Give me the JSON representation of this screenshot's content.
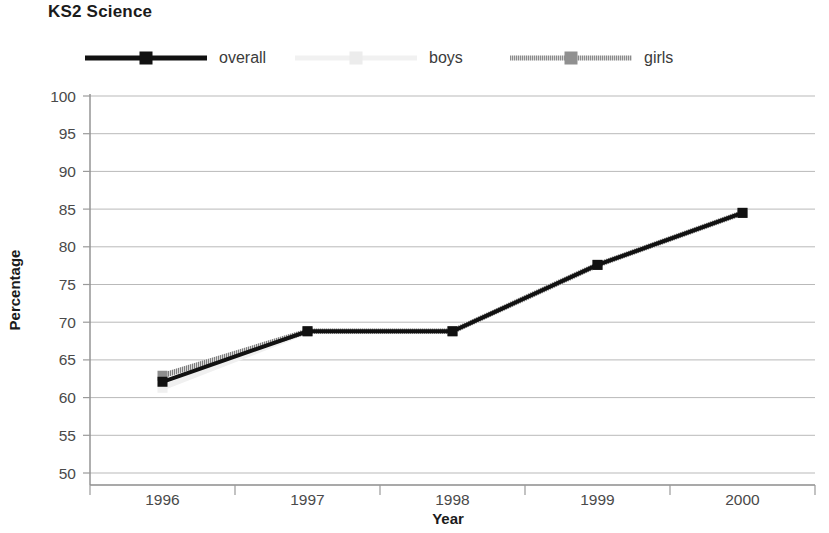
{
  "chart_data": {
    "type": "line",
    "title": "KS2 Science",
    "xlabel": "Year",
    "ylabel": "Percentage",
    "categories": [
      "1996",
      "1997",
      "1998",
      "1999",
      "2000"
    ],
    "x": [
      1996,
      1997,
      1998,
      1999,
      2000
    ],
    "ylim": [
      50,
      100
    ],
    "yticks": [
      50,
      55,
      60,
      65,
      70,
      75,
      80,
      85,
      90,
      95,
      100
    ],
    "ytick_labels": [
      "50",
      "55",
      "60",
      "65",
      "70",
      "75",
      "80",
      "85",
      "90",
      "95",
      "100"
    ],
    "grid": true,
    "legend_position": "top",
    "series": [
      {
        "name": "overall",
        "color": "#111111",
        "marker": "square",
        "values": [
          62.1,
          68.8,
          68.8,
          77.6,
          84.5
        ]
      },
      {
        "name": "boys",
        "color": "#f0f0f0",
        "marker": "square",
        "values": [
          61.3,
          68.8,
          68.8,
          77.6,
          84.5
        ]
      },
      {
        "name": "girls",
        "color": "#8a8a8a",
        "marker": "square",
        "values": [
          62.9,
          68.8,
          68.8,
          77.6,
          84.5
        ]
      }
    ]
  },
  "legend": {
    "items": [
      {
        "label": "overall",
        "color": "#111111"
      },
      {
        "label": "boys",
        "color": "#f0f0f0"
      },
      {
        "label": "girls",
        "color": "#8a8a8a"
      }
    ]
  },
  "axes": {
    "y_title": "Percentage",
    "x_title": "Year"
  }
}
